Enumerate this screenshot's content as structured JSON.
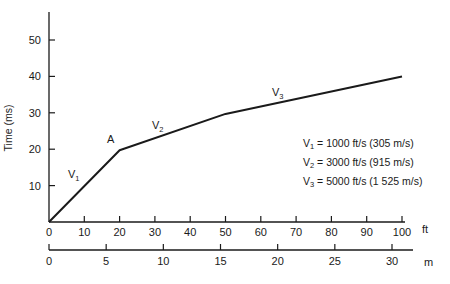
{
  "chart_data": {
    "type": "line",
    "title": "",
    "ylabel": "Time (ms)",
    "xlabel_primary": "ft",
    "xlabel_secondary": "m",
    "xlim": [
      0,
      100
    ],
    "ylim": [
      0,
      57
    ],
    "grid": false,
    "x_ticks_ft": [
      0,
      10,
      20,
      30,
      40,
      50,
      60,
      70,
      80,
      90,
      100
    ],
    "x_ticks_m": [
      0,
      5,
      10,
      15,
      20,
      25,
      30
    ],
    "y_ticks": [
      10,
      20,
      30,
      40,
      50
    ],
    "series": [
      {
        "name": "Travel time",
        "x": [
          0,
          20,
          50,
          100
        ],
        "y": [
          0,
          19.7,
          29.7,
          40.0
        ]
      }
    ],
    "annotations": [
      {
        "text": "V1",
        "x": 7,
        "y": 12
      },
      {
        "text": "A",
        "x": 17.5,
        "y": 22
      },
      {
        "text": "V2",
        "x": 31,
        "y": 25
      },
      {
        "text": "V3",
        "x": 67,
        "y": 36
      }
    ],
    "legend": [
      "V1 = 1000 ft/s (305 m/s)",
      "V2 = 3000 ft/s (915 m/s)",
      "V3 = 5000 ft/s (1 525 m/s)"
    ]
  },
  "axes": {
    "y_title": "Time (ms)",
    "x_unit_ft": "ft",
    "x_unit_m": "m"
  },
  "labels": {
    "v": "V",
    "v1_sub": "1",
    "v2_sub": "2",
    "v3_sub": "3",
    "point_a": "A"
  },
  "legend": {
    "items": [
      {
        "sym": "V",
        "sub": "1",
        "text": " = 1000 ft/s (305 m/s)"
      },
      {
        "sym": "V",
        "sub": "2",
        "text": " = 3000 ft/s (915 m/s)"
      },
      {
        "sym": "V",
        "sub": "3",
        "text": " = 5000 ft/s (1 525 m/s)"
      }
    ]
  }
}
